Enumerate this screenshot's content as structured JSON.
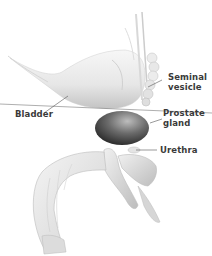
{
  "figure": {
    "labels": {
      "seminal_vesicle_line1": "Seminal",
      "seminal_vesicle_line2": "vesicle",
      "bladder": "Bladder",
      "prostate_line1": "Prostate",
      "prostate_line2": "gland",
      "urethra": "Urethra"
    },
    "colors": {
      "background": "#ffffff",
      "organ_light": "#f2f2f2",
      "organ_mid": "#cfcfcf",
      "organ_dark": "#5a5a5a",
      "prostate_dark": "#2e2e2e",
      "leader_line": "#555555",
      "text": "#3a3a3a"
    }
  }
}
